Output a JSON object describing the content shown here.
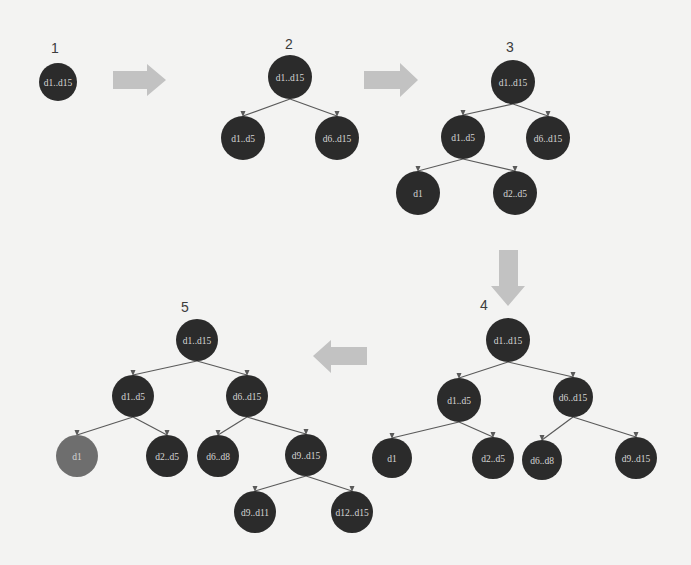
{
  "diagram": {
    "title": "",
    "colors": {
      "background": "#f3f3f2",
      "node_default": "#2b2b2b",
      "node_highlight": "#6e6e6e",
      "node_text": "#d6d6d6",
      "edge": "#5a5a5a",
      "flow_arrow": "#c2c2c2",
      "step_label": "#3c3c3c"
    },
    "flow_arrows": [
      {
        "id": "arrow-1-2",
        "direction": "right",
        "from_step": "1",
        "to_step": "2"
      },
      {
        "id": "arrow-2-3",
        "direction": "right",
        "from_step": "2",
        "to_step": "3"
      },
      {
        "id": "arrow-3-4",
        "direction": "down",
        "from_step": "3",
        "to_step": "4"
      },
      {
        "id": "arrow-4-5",
        "direction": "left",
        "from_step": "4",
        "to_step": "5"
      }
    ],
    "steps": [
      {
        "label": "1",
        "nodes": [
          {
            "id": "s1-root",
            "text": "d1..d15",
            "x": 58,
            "y": 82,
            "r": 19,
            "highlight": false
          }
        ],
        "edges": []
      },
      {
        "label": "2",
        "nodes": [
          {
            "id": "s2-root",
            "text": "d1..d15",
            "x": 290,
            "y": 77,
            "r": 22,
            "highlight": false
          },
          {
            "id": "s2-a",
            "text": "d1..d5",
            "x": 243,
            "y": 138,
            "r": 22,
            "highlight": false
          },
          {
            "id": "s2-b",
            "text": "d6..d15",
            "x": 337,
            "y": 138,
            "r": 22,
            "highlight": false
          }
        ],
        "edges": [
          [
            "s2-root",
            "s2-a"
          ],
          [
            "s2-root",
            "s2-b"
          ]
        ]
      },
      {
        "label": "3",
        "nodes": [
          {
            "id": "s3-root",
            "text": "d1..d15",
            "x": 513,
            "y": 82,
            "r": 22,
            "highlight": false
          },
          {
            "id": "s3-a",
            "text": "d1..d5",
            "x": 463,
            "y": 137,
            "r": 22,
            "highlight": false
          },
          {
            "id": "s3-b",
            "text": "d6..d15",
            "x": 548,
            "y": 138,
            "r": 22,
            "highlight": false
          },
          {
            "id": "s3-aa",
            "text": "d1",
            "x": 418,
            "y": 193,
            "r": 22,
            "highlight": false
          },
          {
            "id": "s3-ab",
            "text": "d2..d5",
            "x": 515,
            "y": 193,
            "r": 22,
            "highlight": false
          }
        ],
        "edges": [
          [
            "s3-root",
            "s3-a"
          ],
          [
            "s3-root",
            "s3-b"
          ],
          [
            "s3-a",
            "s3-aa"
          ],
          [
            "s3-a",
            "s3-ab"
          ]
        ]
      },
      {
        "label": "4",
        "nodes": [
          {
            "id": "s4-root",
            "text": "d1..d15",
            "x": 508,
            "y": 340,
            "r": 22,
            "highlight": false
          },
          {
            "id": "s4-a",
            "text": "d1..d5",
            "x": 459,
            "y": 400,
            "r": 22,
            "highlight": false
          },
          {
            "id": "s4-b",
            "text": "d6..d15",
            "x": 573,
            "y": 397,
            "r": 20,
            "highlight": false
          },
          {
            "id": "s4-aa",
            "text": "d1",
            "x": 392,
            "y": 458,
            "r": 20,
            "highlight": false
          },
          {
            "id": "s4-ab",
            "text": "d2..d5",
            "x": 493,
            "y": 458,
            "r": 21,
            "highlight": false
          },
          {
            "id": "s4-ba",
            "text": "d6..d8",
            "x": 542,
            "y": 460,
            "r": 20,
            "highlight": false
          },
          {
            "id": "s4-bb",
            "text": "d9..d15",
            "x": 636,
            "y": 458,
            "r": 21,
            "highlight": false
          }
        ],
        "edges": [
          [
            "s4-root",
            "s4-a"
          ],
          [
            "s4-root",
            "s4-b"
          ],
          [
            "s4-a",
            "s4-aa"
          ],
          [
            "s4-a",
            "s4-ab"
          ],
          [
            "s4-b",
            "s4-ba"
          ],
          [
            "s4-b",
            "s4-bb"
          ]
        ]
      },
      {
        "label": "5",
        "nodes": [
          {
            "id": "s5-root",
            "text": "d1..d15",
            "x": 197,
            "y": 340,
            "r": 21,
            "highlight": false
          },
          {
            "id": "s5-a",
            "text": "d1..d5",
            "x": 133,
            "y": 396,
            "r": 21,
            "highlight": false
          },
          {
            "id": "s5-b",
            "text": "d6..d15",
            "x": 247,
            "y": 396,
            "r": 21,
            "highlight": false
          },
          {
            "id": "s5-aa",
            "text": "d1",
            "x": 77,
            "y": 456,
            "r": 21,
            "highlight": true
          },
          {
            "id": "s5-ab",
            "text": "d2..d5",
            "x": 167,
            "y": 456,
            "r": 21,
            "highlight": false
          },
          {
            "id": "s5-ba",
            "text": "d6..d8",
            "x": 218,
            "y": 456,
            "r": 21,
            "highlight": false
          },
          {
            "id": "s5-bb",
            "text": "d9..d15",
            "x": 306,
            "y": 455,
            "r": 21,
            "highlight": false
          },
          {
            "id": "s5-bba",
            "text": "d9..d11",
            "x": 255,
            "y": 512,
            "r": 21,
            "highlight": false
          },
          {
            "id": "s5-bbb",
            "text": "d12..d15",
            "x": 352,
            "y": 512,
            "r": 21,
            "highlight": false
          }
        ],
        "edges": [
          [
            "s5-root",
            "s5-a"
          ],
          [
            "s5-root",
            "s5-b"
          ],
          [
            "s5-a",
            "s5-aa"
          ],
          [
            "s5-a",
            "s5-ab"
          ],
          [
            "s5-b",
            "s5-ba"
          ],
          [
            "s5-b",
            "s5-bb"
          ],
          [
            "s5-bb",
            "s5-bba"
          ],
          [
            "s5-bb",
            "s5-bbb"
          ]
        ]
      }
    ]
  }
}
